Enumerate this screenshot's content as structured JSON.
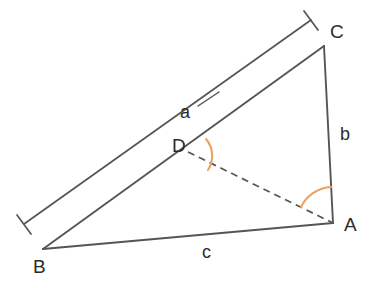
{
  "figure": {
    "width": 379,
    "height": 288,
    "background_color": "#ffffff",
    "stroke_color": "#555555",
    "arc_color": "#e8a45c",
    "label_color": "#2b2b2b"
  },
  "vertices": {
    "A": {
      "label": "A",
      "x": 333,
      "y": 223
    },
    "B": {
      "label": "B",
      "x": 43,
      "y": 249
    },
    "C": {
      "label": "C",
      "x": 324,
      "y": 46
    },
    "D": {
      "label": "D",
      "x": 188,
      "y": 152
    }
  },
  "side_labels": {
    "a": {
      "label": "a",
      "x": 186,
      "y": 113
    },
    "b": {
      "label": "b",
      "x": 345,
      "y": 135
    },
    "c": {
      "label": "c",
      "x": 207,
      "y": 252
    }
  },
  "segments": [
    {
      "name": "side-bc",
      "from": "B",
      "to": "C",
      "style": "solid"
    },
    {
      "name": "side-ca",
      "from": "C",
      "to": "A",
      "style": "solid"
    },
    {
      "name": "side-ab",
      "from": "A",
      "to": "B",
      "style": "solid"
    },
    {
      "name": "cevian-da",
      "from": "D",
      "to": "A",
      "style": "dashed"
    }
  ],
  "measure_line": {
    "name": "measure-line-a",
    "from_x": 24,
    "from_y": 224,
    "to_x": 311,
    "to_y": 20,
    "tick_length": 18,
    "style": "solid"
  },
  "leader_line": {
    "name": "leader-line-a",
    "from_x": 198,
    "from_y": 106,
    "to_x": 219,
    "to_y": 92
  },
  "angle_arcs": [
    {
      "name": "angle-arc-d",
      "vertex": "D",
      "radius": 26,
      "color": "#e8a45c"
    },
    {
      "name": "angle-arc-a",
      "vertex": "A",
      "radius": 36,
      "color": "#e8a45c"
    }
  ]
}
